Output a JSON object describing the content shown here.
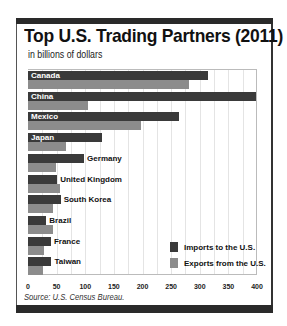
{
  "title": "Top U.S. Trading Partners (2011)",
  "subtitle": "in billions of dollars",
  "source": "Source: U.S. Census Bureau.",
  "legend": {
    "imports_label": "Imports to the U.S.",
    "exports_label": "Exports from the U.S."
  },
  "colors": {
    "imports": "#3a3a3a",
    "exports": "#8c8c8c",
    "frame": "#2a2a2a"
  },
  "axis": {
    "ticks": [
      "0",
      "50",
      "100",
      "150",
      "200",
      "250",
      "300",
      "350",
      "400"
    ]
  },
  "chart_data": {
    "type": "bar",
    "orientation": "horizontal",
    "title": "Top U.S. Trading Partners (2011)",
    "subtitle": "in billions of dollars",
    "xlabel": "",
    "ylabel": "",
    "xlim": [
      0,
      400
    ],
    "x_ticks": [
      0,
      50,
      100,
      150,
      200,
      250,
      300,
      350,
      400
    ],
    "grid": true,
    "legend_position": "bottom-right",
    "categories": [
      "Canada",
      "China",
      "Mexico",
      "Japan",
      "Germany",
      "United Kingdom",
      "South Korea",
      "Brazil",
      "France",
      "Taiwan"
    ],
    "series": [
      {
        "name": "Imports to the U.S.",
        "values": [
          315,
          399,
          263,
          129,
          98,
          51,
          57,
          32,
          40,
          41
        ]
      },
      {
        "name": "Exports from the U.S.",
        "values": [
          281,
          104,
          198,
          66,
          49,
          56,
          44,
          43,
          28,
          26
        ]
      }
    ],
    "source": "Source: U.S. Census Bureau."
  }
}
